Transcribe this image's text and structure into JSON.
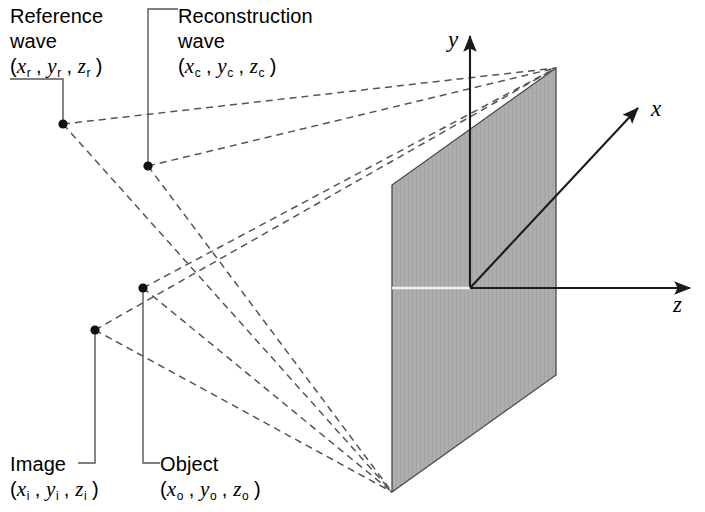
{
  "figure": {
    "type": "3d-coordinate-diagram",
    "background_color": "#ffffff",
    "plate_fill_color": "#ababab",
    "line_color": "#1a1a1a",
    "dashed_ray_color": "#555555"
  },
  "axes": {
    "x": {
      "label": "x",
      "label_x": 651,
      "label_y": 96
    },
    "y": {
      "label": "y",
      "label_x": 448,
      "label_y": 27
    },
    "z": {
      "label": "z",
      "label_x": 673,
      "label_y": 292
    }
  },
  "sources": [
    {
      "id": "reference",
      "name": "Reference wave",
      "line1": "Reference",
      "line2": "wave",
      "coord_open": "(",
      "coord_x": "x",
      "coord_y": "y",
      "coord_z": "z",
      "sub": "r",
      "coord_close": ")",
      "point_x": 63,
      "point_y": 124
    },
    {
      "id": "reconstruction",
      "name": "Reconstruction wave",
      "line1": "Reconstruction",
      "line2": "wave",
      "coord_open": "(",
      "coord_x": "x",
      "coord_y": "y",
      "coord_z": "z",
      "sub": "c",
      "coord_close": ")",
      "point_x": 148,
      "point_y": 166
    },
    {
      "id": "image",
      "name": "Image",
      "line1": "Image",
      "line2": "",
      "coord_open": "(",
      "coord_x": "x",
      "coord_y": "y",
      "coord_z": "z",
      "sub": "i",
      "coord_close": ")",
      "point_x": 95,
      "point_y": 330
    },
    {
      "id": "object",
      "name": "Object",
      "line1": "Object",
      "line2": "",
      "coord_open": "(",
      "coord_x": "x",
      "coord_y": "y",
      "coord_z": "z",
      "sub": "o",
      "coord_close": ")",
      "point_x": 143,
      "point_y": 288
    }
  ],
  "plate": {
    "name": "hologram-plate",
    "corners": [
      [
        556,
        68
      ],
      [
        556,
        375
      ],
      [
        392,
        492
      ],
      [
        392,
        185
      ]
    ],
    "origin": [
      470,
      288
    ]
  },
  "convergence": {
    "top": [
      556,
      68
    ],
    "bottom": [
      392,
      492
    ]
  }
}
